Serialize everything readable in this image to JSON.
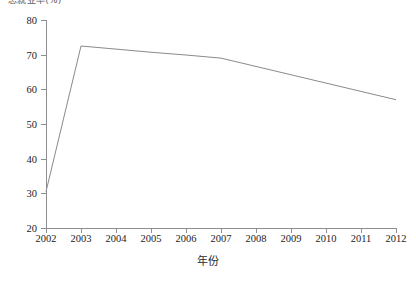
{
  "chart_data": {
    "type": "line",
    "title": "总就业率(%)",
    "title_truncated": true,
    "xlabel": "年份",
    "ylabel": "",
    "categories": [
      "2002",
      "2003",
      "2004",
      "2005",
      "2006",
      "2007",
      "2008",
      "2009",
      "2010",
      "2011",
      "2012"
    ],
    "x": [
      2002,
      2003,
      2004,
      2005,
      2006,
      2007,
      2008,
      2009,
      2010,
      2011,
      2012
    ],
    "values": [
      30.5,
      72.5,
      71.6,
      70.7,
      69.9,
      69.0,
      66.6,
      64.2,
      61.8,
      59.4,
      57.0
    ],
    "yticks": [
      20,
      30,
      40,
      50,
      60,
      70,
      80
    ],
    "ylim": [
      20,
      80
    ],
    "xlim": [
      2002,
      2012
    ],
    "grid": false,
    "legend": false,
    "markers": false,
    "line_color": "#8a8a90",
    "axis_color": "#8d8d92"
  },
  "axis": {
    "x_title": "年份",
    "y_tick_labels": [
      "80",
      "70",
      "60",
      "50",
      "40",
      "30",
      "20"
    ],
    "x_tick_labels": [
      "2002",
      "2003",
      "2004",
      "2005",
      "2006",
      "2007",
      "2008",
      "2009",
      "2010",
      "2011",
      "2012"
    ]
  },
  "header": {
    "clipped_title": "总就业率(%)"
  }
}
